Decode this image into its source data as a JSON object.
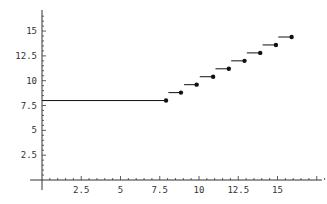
{
  "chart_data": {
    "type": "line",
    "title": "",
    "xlabel": "",
    "ylabel": "",
    "xlim": [
      -0.5,
      18.5
    ],
    "ylim": [
      -1.3,
      17.2
    ],
    "grid": false,
    "legend": null,
    "x_ticks": [
      2.5,
      5,
      7.5,
      10,
      12.5,
      15
    ],
    "x_tick_labels": [
      "2.5",
      "5",
      "7.5",
      "10",
      "12.5",
      "15"
    ],
    "y_ticks": [
      2.5,
      5,
      7.5,
      10,
      12.5,
      15
    ],
    "y_tick_labels": [
      "2.5",
      "5",
      "7.5",
      "10",
      "12.5",
      "15"
    ],
    "series": [
      {
        "name": "step function",
        "style": "horizontal segments ending in filled dots",
        "color": "#111111",
        "points": [
          {
            "x_start": 0,
            "x": 7.9,
            "y": 8.0
          },
          {
            "x_start": 8.05,
            "x": 8.85,
            "y": 8.8
          },
          {
            "x_start": 9.05,
            "x": 9.85,
            "y": 9.6
          },
          {
            "x_start": 10.05,
            "x": 10.9,
            "y": 10.4
          },
          {
            "x_start": 11.05,
            "x": 11.9,
            "y": 11.2
          },
          {
            "x_start": 12.05,
            "x": 12.9,
            "y": 12.0
          },
          {
            "x_start": 13.05,
            "x": 13.9,
            "y": 12.8
          },
          {
            "x_start": 14.05,
            "x": 14.9,
            "y": 13.6
          },
          {
            "x_start": 15.05,
            "x": 15.9,
            "y": 14.4
          }
        ]
      }
    ]
  },
  "colors": {
    "axis": "#333333",
    "series": "#111111",
    "background": "#ffffff"
  }
}
